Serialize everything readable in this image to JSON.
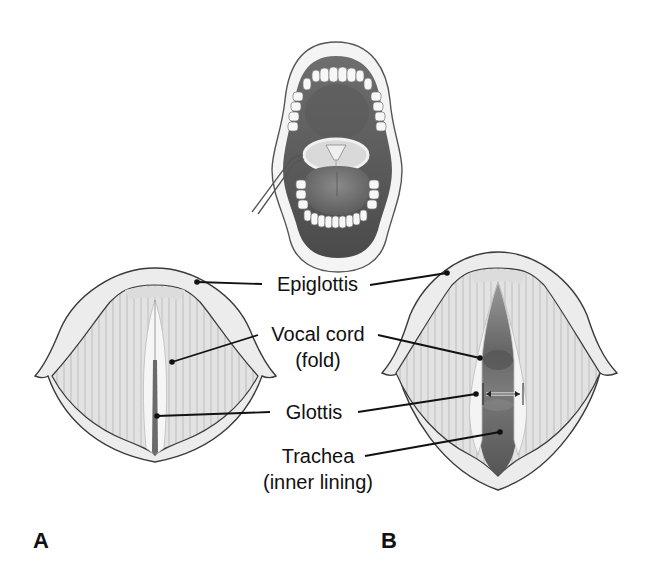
{
  "figure": {
    "type": "anatomical diagram"
  },
  "inset": {
    "name": "open mouth with laryngeal mirror"
  },
  "labels": {
    "epiglottis": "Epiglottis",
    "vocal_cord_line1": "Vocal cord",
    "vocal_cord_line2": "(fold)",
    "glottis": "Glottis",
    "trachea_line1": "Trachea",
    "trachea_line2": "(inner lining)"
  },
  "panels": [
    {
      "letter": "A",
      "state": "vocal cords closed (adducted)"
    },
    {
      "letter": "B",
      "state": "vocal cords open (abducted)"
    }
  ],
  "colors": {
    "outline": "#333333",
    "tissue_light": "#e6e6e6",
    "tissue_mid": "#cfcfcf",
    "cavity_dark": "#5a5a5a",
    "leader_line": "#111111"
  }
}
